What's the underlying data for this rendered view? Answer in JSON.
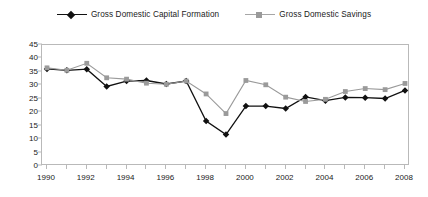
{
  "chart_data": {
    "type": "line",
    "title": "",
    "xlabel": "",
    "ylabel": "",
    "x": [
      1990,
      1991,
      1992,
      1993,
      1994,
      1995,
      1996,
      1997,
      1998,
      1999,
      2000,
      2001,
      2002,
      2003,
      2004,
      2005,
      2006,
      2007,
      2008
    ],
    "xtick_labels": [
      "1990",
      "1992",
      "1994",
      "1996",
      "1998",
      "2000",
      "2002",
      "2004",
      "2006",
      "2008"
    ],
    "xtick_values": [
      1990,
      1992,
      1994,
      1996,
      1998,
      2000,
      2002,
      2004,
      2006,
      2008
    ],
    "xlim": [
      1990,
      2008
    ],
    "ylim": [
      0,
      45
    ],
    "ytick_labels": [
      "0",
      "5",
      "10",
      "15",
      "20",
      "25",
      "30",
      "35",
      "40",
      "45"
    ],
    "ytick_values": [
      0,
      5,
      10,
      15,
      20,
      25,
      30,
      35,
      40,
      45
    ],
    "grid": false,
    "legend_position": "top-center",
    "series": [
      {
        "name": "Gross Domestic Capital Formation",
        "color": "#111111",
        "marker": "diamond",
        "values": [
          36.1,
          35.6,
          36.0,
          29.6,
          31.6,
          31.8,
          30.5,
          31.6,
          16.7,
          11.7,
          22.3,
          22.3,
          21.4,
          25.7,
          24.3,
          25.5,
          25.4,
          25.1,
          28.1
        ]
      },
      {
        "name": "Gross Domestic Savings",
        "color": "#9a9a9a",
        "marker": "square",
        "values": [
          36.5,
          35.6,
          38.2,
          32.8,
          32.3,
          30.8,
          30.4,
          31.6,
          26.8,
          19.5,
          31.8,
          30.2,
          25.6,
          24.0,
          24.8,
          27.7,
          28.8,
          28.4,
          30.7
        ]
      }
    ]
  }
}
